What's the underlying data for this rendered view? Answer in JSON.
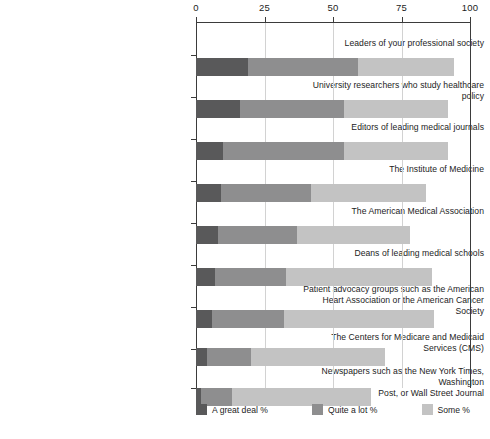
{
  "chart_data": {
    "type": "bar",
    "orientation": "horizontal",
    "stacked": true,
    "title": "",
    "subtitle": "",
    "xlabel": "",
    "ylabel": "",
    "xlim": [
      0,
      100
    ],
    "xticks": [
      0,
      25,
      50,
      75,
      100
    ],
    "xtick_labels": [
      "0",
      "25",
      "50",
      "75",
      "100"
    ],
    "grid": true,
    "legend_position": "bottom",
    "categories": [
      "Leaders of your professional society",
      "University researchers who study healthcare policy",
      "Editors of leading medical journals",
      "The Institute of Medicine",
      "The American Medical Association",
      "Deans of leading medical schools",
      "Patient advocacy groups such as the American\nHeart Association or the American Cancer Society",
      "The Centers for Medicare and Medicaid Services (CMS)",
      "Newspapers such as the New York Times, Washington\nPost, or Wall Street Journal"
    ],
    "series": [
      {
        "name": "A great deal %",
        "color": "#59595a",
        "values": [
          19,
          16,
          10,
          9,
          8,
          7,
          6,
          4,
          2
        ]
      },
      {
        "name": "Quite a lot %",
        "color": "#8e8e8f",
        "values": [
          40,
          38,
          44,
          33,
          29,
          26,
          26,
          16,
          11
        ]
      },
      {
        "name": "Some %",
        "color": "#c3c3c3",
        "values": [
          35,
          38,
          38,
          42,
          41,
          53,
          55,
          49,
          51
        ]
      }
    ],
    "totals": [
      94,
      92,
      92,
      84,
      78,
      86,
      87,
      69,
      64
    ]
  },
  "legend": {
    "items": [
      {
        "label": "A great deal %",
        "color": "#59595a",
        "swatch": "legend-swatch-great-deal"
      },
      {
        "label": "Quite a lot %",
        "color": "#8e8e8f",
        "swatch": "legend-swatch-quite-a-lot"
      },
      {
        "label": "Some %",
        "color": "#c3c3c3",
        "swatch": "legend-swatch-some"
      }
    ]
  },
  "axis": {
    "tick0": "0",
    "tick1": "25",
    "tick2": "50",
    "tick3": "75",
    "tick4": "100"
  }
}
